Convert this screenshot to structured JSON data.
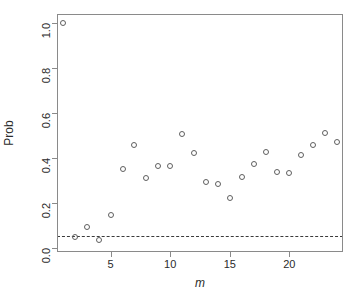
{
  "chart_data": {
    "type": "scatter",
    "title": "",
    "xlabel": "m",
    "ylabel": "Prob",
    "xlim": [
      0.5,
      24.5
    ],
    "ylim": [
      -0.02,
      1.04
    ],
    "grid": false,
    "legend": "none",
    "marker": "open-circle",
    "x": [
      1,
      2,
      3,
      4,
      5,
      6,
      7,
      8,
      9,
      10,
      11,
      12,
      13,
      14,
      15,
      16,
      17,
      18,
      19,
      20,
      21,
      22,
      23,
      24
    ],
    "y": [
      1.0,
      0.045,
      0.09,
      0.035,
      0.145,
      0.35,
      0.455,
      0.31,
      0.365,
      0.365,
      0.505,
      0.42,
      0.29,
      0.285,
      0.22,
      0.315,
      0.37,
      0.425,
      0.335,
      0.33,
      0.41,
      0.455,
      0.51,
      0.47
    ],
    "xticks": [
      5,
      10,
      15,
      20
    ],
    "xtick_labels": [
      "5",
      "10",
      "15",
      "20"
    ],
    "yticks": [
      0.0,
      0.2,
      0.4,
      0.6,
      0.8,
      1.0
    ],
    "ytick_labels": [
      "0.0",
      "0.2",
      "0.4",
      "0.6",
      "0.8",
      "1.0"
    ],
    "reference_lines": [
      {
        "orientation": "horizontal",
        "value": 0.05,
        "style": "dashed",
        "color": "#3b3b3b"
      }
    ],
    "colors": {
      "marker_stroke": "#5f5f5f",
      "axis": "#8a8a8a",
      "text": "#2b2b2b",
      "reference": "#3b3b3b"
    }
  }
}
